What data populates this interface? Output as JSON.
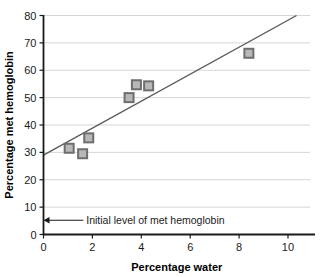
{
  "chart_data": {
    "type": "scatter",
    "title": "",
    "xlabel": "Percentage water",
    "ylabel": "Percentage met hemoglobin",
    "xlim": [
      0,
      10.9
    ],
    "ylim": [
      0,
      80
    ],
    "xticks": [
      0,
      2,
      4,
      6,
      8,
      10
    ],
    "yticks": [
      0,
      10,
      20,
      30,
      40,
      50,
      60,
      70,
      80
    ],
    "xtick_labels": [
      "0",
      "2",
      "4",
      "6",
      "8",
      "10"
    ],
    "ytick_labels": [
      "0",
      "10",
      "20",
      "30",
      "40",
      "50",
      "60",
      "70",
      "80"
    ],
    "grid": "horizontal",
    "legend": "none",
    "marker": "square",
    "marker_color": "#9a9a9a",
    "marker_edge_color": "#6e6e6e",
    "line_color": "#5a5a5a",
    "axis_color": "#1a1a1a",
    "grid_color": "#d6d6d6",
    "points": [
      {
        "x": 1.05,
        "y": 31.5
      },
      {
        "x": 1.6,
        "y": 29.5
      },
      {
        "x": 1.85,
        "y": 35.3
      },
      {
        "x": 3.5,
        "y": 50.0
      },
      {
        "x": 3.8,
        "y": 54.7
      },
      {
        "x": 4.3,
        "y": 54.3
      },
      {
        "x": 8.4,
        "y": 66.2
      }
    ],
    "trendline": {
      "x0": 0,
      "y0": 29.0,
      "x1": 10.35,
      "y1": 80.0
    },
    "annotations": [
      {
        "text": "Initial level of met hemoglobin",
        "target_x": 0,
        "target_y": 5.2,
        "label_x": 1.75,
        "label_y": 5.2
      }
    ]
  }
}
